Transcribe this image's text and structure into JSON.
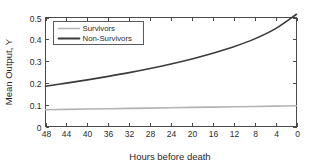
{
  "chart_data": {
    "type": "line",
    "title": "",
    "xlabel": "Hours before death",
    "ylabel": "Mean Output, Y",
    "xlim": [
      48,
      0
    ],
    "ylim": [
      0,
      0.5
    ],
    "x_reversed": true,
    "grid": false,
    "legend_position": "upper-left",
    "xticks": [
      48,
      44,
      40,
      36,
      32,
      28,
      24,
      20,
      16,
      12,
      8,
      4,
      0
    ],
    "xticklabels": [
      "48",
      "44",
      "40",
      "36",
      "32",
      "28",
      "24",
      "20",
      "16",
      "12",
      "8",
      "4",
      "0"
    ],
    "yticks": [
      0,
      0.1,
      0.2,
      0.3,
      0.4,
      0.5
    ],
    "yticklabels": [
      "0",
      "0.1",
      "0.2",
      "0.3",
      "0.4",
      "0.5"
    ],
    "x": [
      48,
      44,
      40,
      36,
      32,
      28,
      24,
      20,
      16,
      12,
      8,
      4,
      0
    ],
    "series": [
      {
        "name": "Survivors",
        "color": "#b3b3b3",
        "width": 1.6,
        "values": [
          0.077,
          0.0785,
          0.08,
          0.0815,
          0.083,
          0.0845,
          0.086,
          0.0875,
          0.089,
          0.0905,
          0.092,
          0.0935,
          0.095
        ]
      },
      {
        "name": "Non-Survivors",
        "color": "#3a3a3a",
        "width": 1.6,
        "values": [
          0.185,
          0.199,
          0.214,
          0.23,
          0.247,
          0.266,
          0.287,
          0.31,
          0.336,
          0.366,
          0.402,
          0.449,
          0.515
        ]
      }
    ]
  },
  "legend": {
    "items": [
      {
        "label": "Survivors",
        "color": "#b3b3b3"
      },
      {
        "label": "Non-Survivors",
        "color": "#3a3a3a"
      }
    ]
  },
  "colors": {
    "axis": "#4a4a4a",
    "text": "#2b2b2b",
    "background": "#ffffff"
  }
}
